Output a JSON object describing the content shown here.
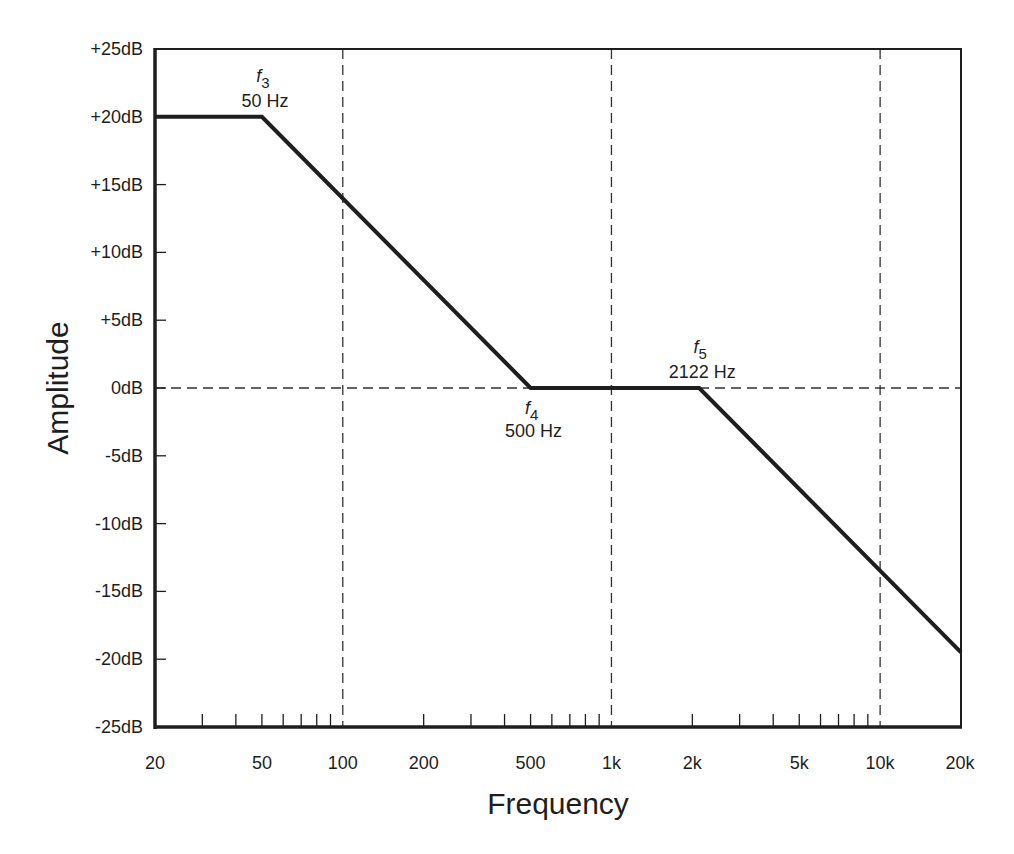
{
  "chart_data": {
    "type": "line",
    "title": "",
    "xlabel": "Frequency",
    "ylabel": "Amplitude",
    "xscale": "log",
    "xlim": [
      20,
      20000
    ],
    "ylim": [
      -25,
      25
    ],
    "yunit": "dB",
    "grid": "dashed reference lines at 100 Hz, 1 kHz, 10 kHz and 0 dB",
    "legend": null,
    "x_tick_labels": [
      {
        "value": 20,
        "label": "20"
      },
      {
        "value": 50,
        "label": "50"
      },
      {
        "value": 100,
        "label": "100"
      },
      {
        "value": 200,
        "label": "200"
      },
      {
        "value": 500,
        "label": "500"
      },
      {
        "value": 1000,
        "label": "1k"
      },
      {
        "value": 2000,
        "label": "2k"
      },
      {
        "value": 5000,
        "label": "5k"
      },
      {
        "value": 10000,
        "label": "10k"
      },
      {
        "value": 20000,
        "label": "20k"
      }
    ],
    "x_minor_ticks": [
      30,
      40,
      50,
      60,
      70,
      80,
      90,
      200,
      300,
      400,
      500,
      600,
      700,
      800,
      900,
      2000,
      3000,
      4000,
      5000,
      6000,
      7000,
      8000,
      9000
    ],
    "y_tick_labels": [
      {
        "value": 25,
        "label": "+25dB"
      },
      {
        "value": 20,
        "label": "+20dB"
      },
      {
        "value": 15,
        "label": "+15dB"
      },
      {
        "value": 10,
        "label": "+10dB"
      },
      {
        "value": 5,
        "label": "+5dB"
      },
      {
        "value": 0,
        "label": "0dB"
      },
      {
        "value": -5,
        "label": "-5dB"
      },
      {
        "value": -10,
        "label": "-10dB"
      },
      {
        "value": -15,
        "label": "-15dB"
      },
      {
        "value": -20,
        "label": "-20dB"
      },
      {
        "value": -25,
        "label": "-25dB"
      }
    ],
    "vertical_reference_lines": [
      100,
      1000,
      10000
    ],
    "horizontal_reference_lines": [
      0
    ],
    "series": [
      {
        "name": "Response",
        "x": [
          20,
          50,
          500,
          2122,
          20000
        ],
        "y": [
          20,
          20,
          0,
          0,
          -19.5
        ]
      }
    ],
    "annotations": [
      {
        "symbol": "f",
        "subscript": "3",
        "value": "50 Hz",
        "x": 50,
        "y": 20,
        "position": "above"
      },
      {
        "symbol": "f",
        "subscript": "4",
        "value": "500 Hz",
        "x": 500,
        "y": 0,
        "position": "below"
      },
      {
        "symbol": "f",
        "subscript": "5",
        "value": "2122 Hz",
        "x": 2122,
        "y": 0,
        "position": "above"
      }
    ],
    "colors": {
      "line": "#1e1e1e",
      "axis": "#1e1e1e",
      "reference": "#333333",
      "background": "#ffffff"
    }
  }
}
